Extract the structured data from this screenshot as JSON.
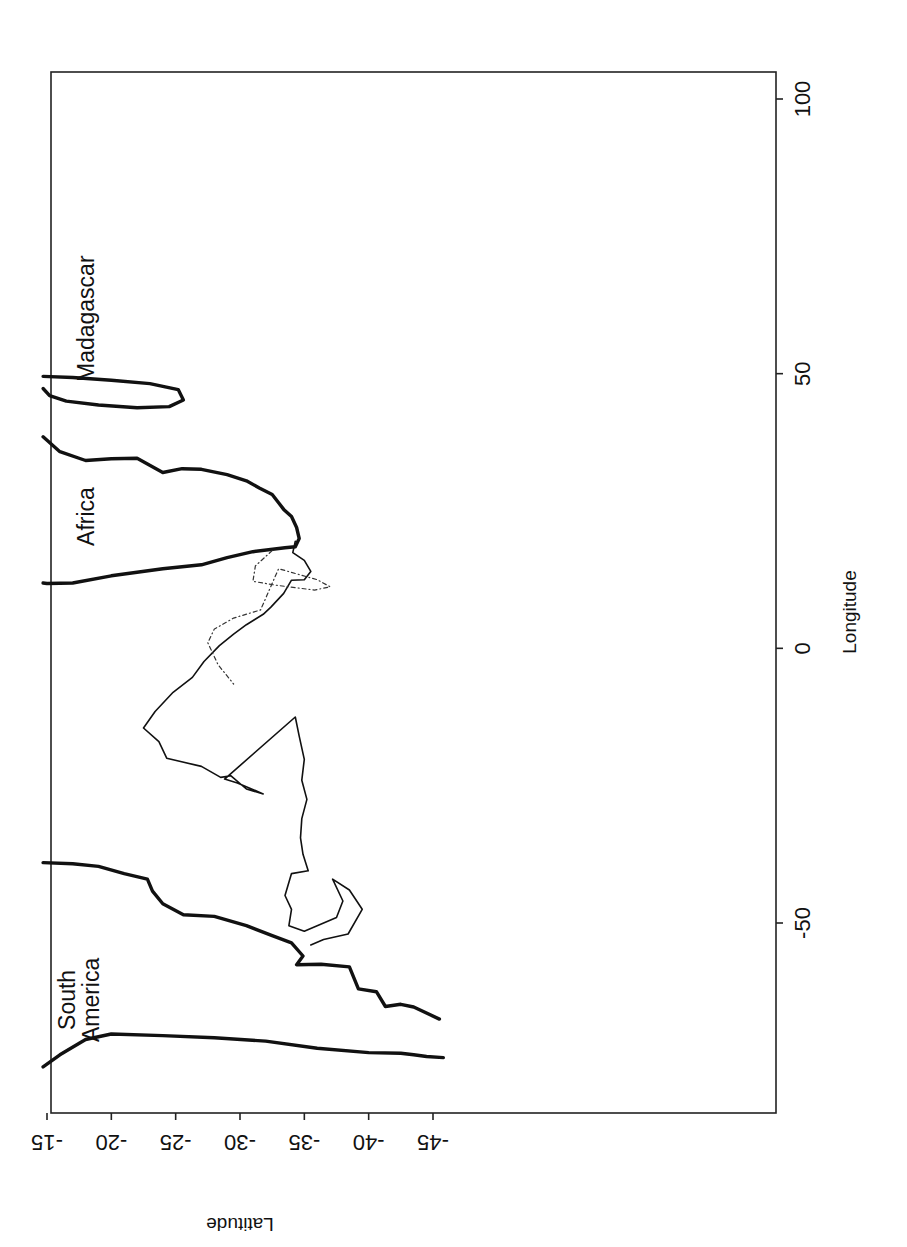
{
  "chart_data": {
    "type": "line",
    "title": "",
    "orientation_note": "Figure printed rotated 90 degrees: latitude axis along bottom (upside-down labels), longitude axis along right side.",
    "xlabel": "Latitude",
    "ylabel": "Longitude",
    "x_axis": {
      "label": "Latitude",
      "ticks": [
        -15,
        -20,
        -25,
        -30,
        -35,
        -40,
        -45
      ],
      "tick_labels": [
        "-15",
        "-20",
        "-25",
        "-30",
        "-35",
        "-40",
        "-45"
      ],
      "range": [
        -14.7,
        -46
      ]
    },
    "y_axis": {
      "label": "Longitude",
      "ticks": [
        -50,
        0,
        50,
        100
      ],
      "tick_labels": [
        "-50",
        "0",
        "50",
        "100"
      ],
      "range": [
        -84,
        105
      ]
    },
    "grid": false,
    "legend": null,
    "annotations": [
      {
        "text": "Madagascar",
        "lat": -18,
        "lon": 60
      },
      {
        "text": "Africa",
        "lat": -18,
        "lon": 24
      },
      {
        "text": "South America",
        "lat": -17.5,
        "lon": -64
      }
    ],
    "series": [
      {
        "name": "Africa coastline",
        "style": "thick solid",
        "points": [
          [
            -14.7,
            38.5
          ],
          [
            -16,
            35.8
          ],
          [
            -18,
            34.2
          ],
          [
            -20,
            34.5
          ],
          [
            -22,
            34.6
          ],
          [
            -24,
            32
          ],
          [
            -25.5,
            32.7
          ],
          [
            -27,
            32.6
          ],
          [
            -29,
            31.6
          ],
          [
            -30.5,
            30.5
          ],
          [
            -31.5,
            29.2
          ],
          [
            -32.5,
            28.0
          ],
          [
            -33,
            26.5
          ],
          [
            -33.4,
            25.3
          ],
          [
            -34,
            24
          ],
          [
            -34.4,
            22
          ],
          [
            -34.6,
            20.0
          ],
          [
            -34.3,
            18.5
          ],
          [
            -33.5,
            18.3
          ],
          [
            -31,
            17.6
          ],
          [
            -29,
            16.5
          ],
          [
            -27,
            15.2
          ],
          [
            -24,
            14.5
          ],
          [
            -20,
            13.2
          ],
          [
            -17,
            11.9
          ],
          [
            -15,
            11.8
          ],
          [
            -14.7,
            11.9
          ]
        ]
      },
      {
        "name": "Madagascar coastline",
        "style": "thick solid",
        "points": [
          [
            -14.7,
            49.5
          ],
          [
            -17,
            49.3
          ],
          [
            -20,
            48.8
          ],
          [
            -23,
            48.2
          ],
          [
            -25.2,
            47.1
          ],
          [
            -25.6,
            45.2
          ],
          [
            -24.5,
            44.0
          ],
          [
            -22,
            43.8
          ],
          [
            -19,
            44.3
          ],
          [
            -16.5,
            45.0
          ],
          [
            -15.2,
            46.0
          ],
          [
            -14.7,
            47.3
          ]
        ]
      },
      {
        "name": "South America coastline (west)",
        "style": "thick solid",
        "points": [
          [
            -14.7,
            -76.2
          ],
          [
            -16,
            -74.0
          ],
          [
            -18,
            -71.2
          ],
          [
            -20,
            -70.2
          ],
          [
            -24,
            -70.5
          ],
          [
            -28,
            -70.9
          ],
          [
            -32,
            -71.5
          ],
          [
            -36,
            -72.8
          ],
          [
            -40,
            -73.6
          ],
          [
            -42.5,
            -73.7
          ],
          [
            -43.5,
            -74.0
          ],
          [
            -44.5,
            -74.3
          ],
          [
            -45.8,
            -74.5
          ]
        ]
      },
      {
        "name": "South America coastline (east)",
        "style": "thick solid",
        "points": [
          [
            -14.7,
            -39.0
          ],
          [
            -17,
            -39.2
          ],
          [
            -19,
            -39.7
          ],
          [
            -21,
            -41.0
          ],
          [
            -22.8,
            -42.0
          ],
          [
            -23.2,
            -44.2
          ],
          [
            -24,
            -46.5
          ],
          [
            -25.6,
            -48.5
          ],
          [
            -28,
            -48.8
          ],
          [
            -30.5,
            -50.5
          ],
          [
            -32.5,
            -52.3
          ],
          [
            -34.0,
            -53.6
          ],
          [
            -34.9,
            -56.0
          ],
          [
            -34.4,
            -57.6
          ],
          [
            -36.3,
            -57.5
          ],
          [
            -38.5,
            -58.0
          ],
          [
            -39.2,
            -62.0
          ],
          [
            -40.6,
            -62.5
          ],
          [
            -41.3,
            -65.2
          ],
          [
            -42.5,
            -64.8
          ],
          [
            -43.5,
            -65.3
          ],
          [
            -45.5,
            -67.5
          ]
        ]
      },
      {
        "name": "Albatross track (solid)",
        "style": "thin solid",
        "points": [
          [
            -34.3,
            19.5
          ],
          [
            -34.1,
            17.4
          ],
          [
            -35.0,
            16.0
          ],
          [
            -35.5,
            14.0
          ],
          [
            -35.0,
            12.5
          ],
          [
            -34.0,
            12.4
          ],
          [
            -33.4,
            10.0
          ],
          [
            -32.4,
            7.5
          ],
          [
            -31.8,
            6.2
          ],
          [
            -30.5,
            4.3
          ],
          [
            -29.5,
            2.6
          ],
          [
            -28.4,
            0.5
          ],
          [
            -27.2,
            -2.4
          ],
          [
            -26.3,
            -5.3
          ],
          [
            -24.8,
            -8.0
          ],
          [
            -23.4,
            -11.5
          ],
          [
            -22.5,
            -14.5
          ],
          [
            -23.7,
            -17.0
          ],
          [
            -24.3,
            -20.0
          ],
          [
            -27.0,
            -21.5
          ],
          [
            -28.5,
            -23.5
          ],
          [
            -29.3,
            -23.2
          ],
          [
            -30.5,
            -25.6
          ],
          [
            -31.8,
            -26.5
          ],
          [
            -29.8,
            -24.5
          ],
          [
            -28.8,
            -23.8
          ],
          [
            -34.3,
            -12.5
          ],
          [
            -34.6,
            -16.0
          ],
          [
            -35.0,
            -20.2
          ],
          [
            -34.8,
            -24.0
          ],
          [
            -35.2,
            -27.5
          ],
          [
            -34.8,
            -31.0
          ],
          [
            -34.7,
            -34.5
          ],
          [
            -34.9,
            -37.5
          ],
          [
            -35.3,
            -40.5
          ],
          [
            -34.0,
            -41.0
          ],
          [
            -33.5,
            -45.0
          ],
          [
            -34.0,
            -47.5
          ],
          [
            -33.8,
            -50.5
          ],
          [
            -35.0,
            -51.5
          ],
          [
            -37.5,
            -49.0
          ],
          [
            -38.0,
            -46.0
          ],
          [
            -37.2,
            -42.0
          ],
          [
            -38.5,
            -44.0
          ],
          [
            -39.5,
            -47.5
          ],
          [
            -38.4,
            -52.0
          ],
          [
            -36.5,
            -53.0
          ],
          [
            -35.5,
            -54.0
          ]
        ]
      },
      {
        "name": "Albatross track (dotted)",
        "style": "thin dotted",
        "points": [
          [
            -32.5,
            17.8
          ],
          [
            -31.2,
            15.0
          ],
          [
            -31.0,
            12.2
          ],
          [
            -32.8,
            11.5
          ],
          [
            -35.8,
            10.6
          ],
          [
            -37.0,
            11.2
          ],
          [
            -36.0,
            12.5
          ],
          [
            -33.0,
            14.5
          ],
          [
            -31.6,
            7.0
          ],
          [
            -29.5,
            5.5
          ],
          [
            -28.0,
            3.5
          ],
          [
            -27.5,
            1.0
          ],
          [
            -28.3,
            -3.0
          ],
          [
            -29.5,
            -6.5
          ]
        ]
      }
    ]
  }
}
